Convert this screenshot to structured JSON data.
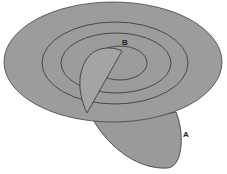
{
  "diagram": {
    "labels": {
      "a": "A",
      "b": "B"
    },
    "colors": {
      "fill": "#9a9a9a",
      "stroke": "#333333",
      "background": "#ffffff"
    }
  }
}
